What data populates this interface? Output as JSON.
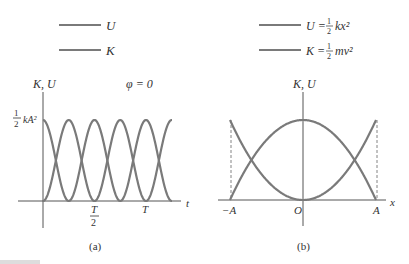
{
  "panel_a": {
    "legend": [
      {
        "label": "U"
      },
      {
        "label": "K"
      }
    ],
    "ylabel": "K, U",
    "phase": "φ = 0",
    "ymax_label_frac": "1/2",
    "ymax_label": "kA²",
    "xlabel": "t",
    "ticks": [
      "T/2",
      "T"
    ],
    "caption": "(a)"
  },
  "panel_b": {
    "legend": [
      {
        "label": "U = ½ kx²"
      },
      {
        "label": "K = ½ mv²"
      }
    ],
    "ylabel": "K, U",
    "xlabel": "x",
    "ticks": [
      "−A",
      "O",
      "A"
    ],
    "caption": "(b)"
  },
  "colors": {
    "curve": "#7a7a7a",
    "axis": "#555555"
  }
}
